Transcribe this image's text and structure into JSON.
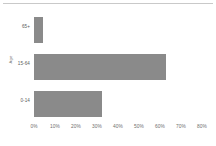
{
  "chart_data": {
    "type": "bar",
    "orientation": "horizontal",
    "title": "",
    "subtitle": "",
    "xlabel": "",
    "ylabel": "Age",
    "categories": [
      "0-14",
      "15-64",
      "65+"
    ],
    "values": [
      32.5,
      63.0,
      4.3
    ],
    "series": [
      {
        "name": "Share of population",
        "values": [
          32.5,
          63.0,
          4.3
        ]
      }
    ],
    "xlim": [
      0,
      80
    ],
    "ylim": null,
    "x_tick_labels": [
      "0%",
      "10%",
      "20%",
      "30%",
      "40%",
      "50%",
      "60%",
      "70%",
      "80%"
    ],
    "x_tick_values": [
      0,
      10,
      20,
      30,
      40,
      50,
      60,
      70,
      80
    ],
    "y_tick_labels": [
      "0-14",
      "15-64",
      "65+"
    ],
    "grid": false,
    "legend": null,
    "legend_position": "none",
    "annotations": [],
    "bar_color": "#8a8a8a",
    "plot_background": "#ffffff",
    "tick_label_color": "#6e6e6e",
    "axis_title_color": "#6e6e6e",
    "category_label_color": "#5c5c5c",
    "top_rule_color": "#c9c9c9"
  },
  "bars": [
    {
      "category": "65+",
      "value": 4.3,
      "label": "65+"
    },
    {
      "category": "15-64",
      "value": 63.0,
      "label": "15-64"
    },
    {
      "category": "0-14",
      "value": 32.5,
      "label": "0-14"
    }
  ],
  "axis": {
    "y_title": "Age",
    "ticks": [
      {
        "label": "0%",
        "value": 0
      },
      {
        "label": "10%",
        "value": 10
      },
      {
        "label": "20%",
        "value": 20
      },
      {
        "label": "30%",
        "value": 30
      },
      {
        "label": "40%",
        "value": 40
      },
      {
        "label": "50%",
        "value": 50
      },
      {
        "label": "60%",
        "value": 60
      },
      {
        "label": "70%",
        "value": 70
      },
      {
        "label": "80%",
        "value": 80
      }
    ]
  }
}
